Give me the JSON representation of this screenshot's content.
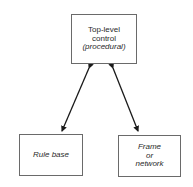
{
  "diagram": {
    "nodes": [
      {
        "id": "top-level-control",
        "lines": [
          {
            "text": "Top-level",
            "italic": false
          },
          {
            "text": "control",
            "italic": false
          },
          {
            "text": "(procedural)",
            "italic": true
          }
        ]
      },
      {
        "id": "rule-base",
        "lines": [
          {
            "text": "Rule base",
            "italic": true
          }
        ]
      },
      {
        "id": "frame-or-network",
        "lines": [
          {
            "text": "Frame",
            "italic": true
          },
          {
            "text": "or",
            "italic": true
          },
          {
            "text": "network",
            "italic": true
          }
        ]
      }
    ],
    "edges": [
      {
        "from": "top-level-control",
        "to": "rule-base",
        "type": "bidirectional-arrow"
      },
      {
        "from": "top-level-control",
        "to": "frame-or-network",
        "type": "bidirectional-arrow"
      }
    ],
    "colors": {
      "border": "#6a6a6a",
      "arrow": "#1a1a1a",
      "text": "#2a2a2a",
      "background": "#ffffff"
    }
  }
}
